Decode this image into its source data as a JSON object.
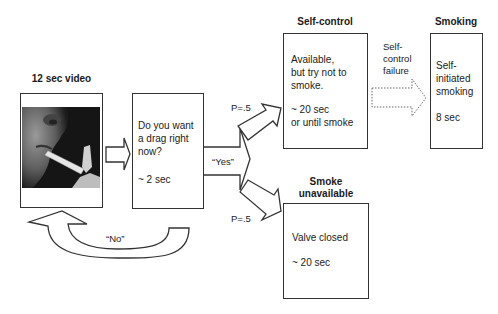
{
  "diagram": {
    "type": "flowchart",
    "nodes": {
      "video": {
        "title": "12 sec video",
        "image_alt": "close-up of person smoking a cigarette"
      },
      "question": {
        "lines": [
          "Do you want",
          "a drag right",
          "now?"
        ],
        "duration": "~ 2 sec"
      },
      "self_control": {
        "title": "Self-control",
        "lines": [
          "Available,",
          "but try not to",
          "smoke."
        ],
        "duration_lines": [
          "~ 20 sec",
          "or until smoke"
        ]
      },
      "smoking": {
        "title": "Smoking",
        "lines": [
          "Self-",
          "initiated",
          "smoking"
        ],
        "duration": "8 sec"
      },
      "unavailable": {
        "title_lines": [
          "Smoke",
          "unavailable"
        ],
        "lines": [
          "Valve closed"
        ],
        "duration": "~ 20 sec"
      }
    },
    "edges": {
      "yes": {
        "label": "“Yes”"
      },
      "no": {
        "label": "“No”"
      },
      "p_upper": {
        "label": "P=.5"
      },
      "p_lower": {
        "label": "P=.5"
      },
      "failure": {
        "label_lines": [
          "Self-",
          "control",
          "failure"
        ]
      }
    },
    "colors": {
      "stroke": "#333333",
      "text": "#222222",
      "background": "#ffffff",
      "dotted": "#555555"
    }
  }
}
